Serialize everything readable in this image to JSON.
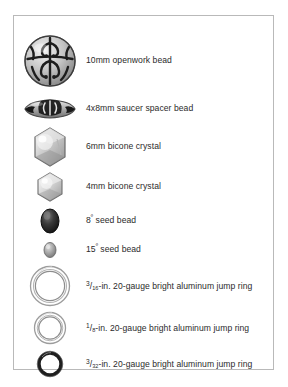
{
  "panel": {
    "name": "materials-legend-panel",
    "border_color": "#b9b9b9",
    "background": "#ffffff"
  },
  "items": [
    {
      "icon": "openwork-round-bead-icon",
      "label": "10mm openwork bead",
      "size": "10mm",
      "type": "openwork bead",
      "color": "#8f8f8f",
      "art": "round-filigree"
    },
    {
      "icon": "saucer-spacer-bead-icon",
      "label": "4x8mm saucer spacer bead",
      "size": "4x8mm",
      "type": "saucer spacer bead",
      "color": "#7a7a7a",
      "art": "saucer"
    },
    {
      "icon": "bicone-crystal-6mm-icon",
      "label": "6mm bicone crystal",
      "size": "6mm",
      "type": "bicone crystal",
      "color": "#c9c9c9",
      "art": "bicone-large"
    },
    {
      "icon": "bicone-crystal-4mm-icon",
      "label": "4mm bicone crystal",
      "size": "4mm",
      "type": "bicone crystal",
      "color": "#d2d2d2",
      "art": "bicone-small"
    },
    {
      "icon": "seed-bead-8-icon",
      "label_pre": "8",
      "label_sup": "º",
      "label_post": " seed bead",
      "label": "8º seed bead",
      "size": "8º",
      "type": "seed bead",
      "color": "#2e2e2e",
      "art": "seed-large"
    },
    {
      "icon": "seed-bead-15-icon",
      "label_pre": "15",
      "label_sup": "º",
      "label_post": " seed bead",
      "label": "15º seed bead",
      "size": "15º",
      "type": "seed bead",
      "color": "#9a9a9a",
      "art": "seed-small"
    },
    {
      "icon": "jump-ring-3-16-icon",
      "frac_num": "3",
      "frac_den": "16",
      "label_post": "-in. 20-gauge bright aluminum jump ring",
      "label": "3/16-in. 20-gauge bright aluminum jump ring",
      "size": "3/16-in.",
      "gauge": "20-gauge",
      "material": "bright aluminum",
      "type": "jump ring",
      "color": "#a6a6a6",
      "art": "ring-large"
    },
    {
      "icon": "jump-ring-1-8-icon",
      "frac_num": "1",
      "frac_den": "8",
      "label_post": "-in. 20-gauge bright aluminum jump ring",
      "label": "1/8-in. 20-gauge bright aluminum jump ring",
      "size": "1/8-in.",
      "gauge": "20-gauge",
      "material": "bright aluminum",
      "type": "jump ring",
      "color": "#a6a6a6",
      "art": "ring-medium"
    },
    {
      "icon": "jump-ring-3-32-icon",
      "frac_num": "3",
      "frac_den": "32",
      "label_post": "-in. 20-gauge bright aluminum jump ring",
      "label": "3/32-in. 20-gauge bright aluminum jump ring",
      "size": "3/32-in.",
      "gauge": "20-gauge",
      "material": "bright aluminum",
      "type": "jump ring",
      "color": "#1f1f1f",
      "art": "ring-small"
    }
  ]
}
